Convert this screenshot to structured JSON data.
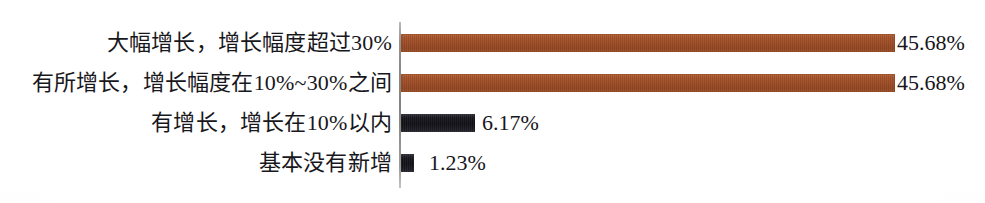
{
  "chart_data": {
    "type": "bar",
    "orientation": "horizontal",
    "title": "",
    "subtitle": "",
    "xlabel": "",
    "ylabel": "",
    "grid": false,
    "legend": false,
    "axis": {
      "category_axis": "vertical-left",
      "value_axis_visible": false,
      "value_unit": "%",
      "xlim": [
        0,
        50
      ]
    },
    "categories": [
      "大幅增长，增长幅度超过30%",
      "有所增长，增长幅度在10%~30%之间",
      "有增长，增长在10%以内",
      "基本没有新增"
    ],
    "values": [
      45.68,
      45.68,
      6.17,
      1.23
    ],
    "value_labels": [
      "45.68%",
      "45.68%",
      "6.17%",
      "1.23%"
    ],
    "bar_colors": [
      "#9b4a24",
      "#9b4a24",
      "#17161c",
      "#17161c"
    ],
    "colors": {
      "brown": "#9b4a24",
      "black": "#17161c",
      "axis": "#8e8b86",
      "text": "#18171c",
      "background": "#ffffff"
    }
  },
  "rows": [
    {
      "label": "大幅增长，增长幅度超过30%",
      "value": "45.68%"
    },
    {
      "label": "有所增长，增长幅度在10%~30%之间",
      "value": "45.68%"
    },
    {
      "label": "有增长，增长在10%以内",
      "value": "6.17%"
    },
    {
      "label": "基本没有新增",
      "value": "1.23%"
    }
  ]
}
